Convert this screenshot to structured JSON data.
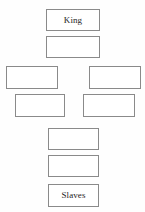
{
  "diagram": {
    "type": "hierarchy-cross-diagram",
    "background_color": "#fefefe",
    "border_color": "#8a8a8a",
    "text_color": "#1d1d1d",
    "canvas": {
      "width": 145,
      "height": 212
    },
    "nodes": [
      {
        "id": "node-king",
        "name": "king-box",
        "label": "King",
        "row": 1,
        "position": "center",
        "x": 46,
        "y": 9,
        "width": 54,
        "height": 22
      },
      {
        "id": "node-rank-2",
        "name": "rank-2-box",
        "label": "",
        "row": 2,
        "position": "center",
        "x": 46,
        "y": 36,
        "width": 54,
        "height": 22
      },
      {
        "id": "node-rank-3-left",
        "name": "rank-3-left-box",
        "label": "",
        "row": 3,
        "position": "left",
        "x": 6,
        "y": 66,
        "width": 52,
        "height": 23
      },
      {
        "id": "node-rank-3-right",
        "name": "rank-3-right-box",
        "label": "",
        "row": 3,
        "position": "right",
        "x": 89,
        "y": 66,
        "width": 52,
        "height": 23
      },
      {
        "id": "node-rank-4-left",
        "name": "rank-4-left-box",
        "label": "",
        "row": 4,
        "position": "left",
        "x": 15,
        "y": 94,
        "width": 50,
        "height": 23
      },
      {
        "id": "node-rank-4-right",
        "name": "rank-4-right-box",
        "label": "",
        "row": 4,
        "position": "right",
        "x": 83,
        "y": 94,
        "width": 52,
        "height": 23
      },
      {
        "id": "node-rank-5",
        "name": "rank-5-box",
        "label": "",
        "row": 5,
        "position": "center",
        "x": 48,
        "y": 128,
        "width": 51,
        "height": 22
      },
      {
        "id": "node-rank-6",
        "name": "rank-6-box",
        "label": "",
        "row": 6,
        "position": "center",
        "x": 48,
        "y": 155,
        "width": 51,
        "height": 22
      },
      {
        "id": "node-slaves",
        "name": "slaves-box",
        "label": "Slaves",
        "row": 7,
        "position": "center",
        "x": 48,
        "y": 184,
        "width": 51,
        "height": 23
      }
    ]
  }
}
